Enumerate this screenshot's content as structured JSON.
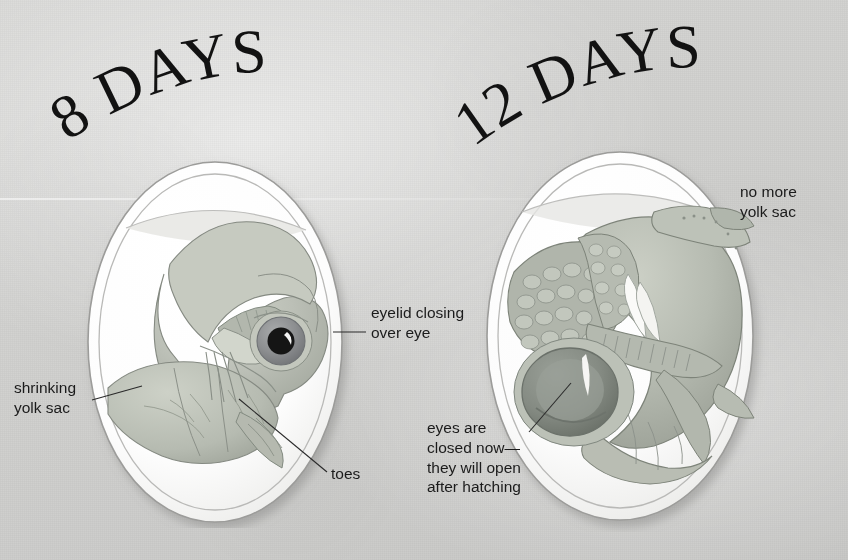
{
  "page": {
    "background_color": "#d2d2d0",
    "width": 848,
    "height": 560,
    "kind": "book-page-scan"
  },
  "panels": [
    {
      "id": "panel-8-days",
      "title": "8 DAYS",
      "subject": "bird embryo inside egg at 8 days",
      "egg": {
        "shell_color": "#ffffff",
        "outline_color": "#9a9a98",
        "center_x": 213,
        "center_y": 340,
        "radius_x": 122,
        "radius_y": 175
      },
      "embryo_colors": {
        "body": "#b9bdb4",
        "shade": "#a3a89e",
        "highlight": "#d3d7cd",
        "line": "#7e837a"
      },
      "eye": {
        "iris_color": "#8d8f91",
        "pupil_color": "#121212",
        "highlight_color": "#ffffff"
      },
      "annotations": [
        {
          "id": "annotation-eyelid",
          "text": "eyelid closing\nover eye",
          "align": "left",
          "x": 371,
          "y": 303,
          "leader": {
            "x1": 333,
            "y1": 332,
            "x2": 366,
            "y2": 332
          }
        },
        {
          "id": "annotation-shrinking-yolk-sac",
          "text": "shrinking\nyolk sac",
          "align": "left",
          "x": 14,
          "y": 378,
          "leader": {
            "x1": 92,
            "y1": 400,
            "x2": 142,
            "y2": 386
          }
        },
        {
          "id": "annotation-toes",
          "text": "toes",
          "align": "left",
          "x": 331,
          "y": 464,
          "leader": {
            "x1": 239,
            "y1": 399,
            "x2": 327,
            "y2": 472
          }
        }
      ]
    },
    {
      "id": "panel-12-days",
      "title": "12 DAYS",
      "subject": "bird embryo inside egg at 12 days",
      "egg": {
        "shell_color": "#ffffff",
        "outline_color": "#9a9a98",
        "center_x": 620,
        "center_y": 336,
        "radius_x": 133,
        "radius_y": 182
      },
      "embryo_colors": {
        "body": "#b7bbb2",
        "shade": "#9aa096",
        "highlight": "#d5d9cf",
        "line": "#7b8077"
      },
      "eye": {
        "eyelid_color": "#8e948c",
        "eyelid_shade": "#6e746c"
      },
      "annotations": [
        {
          "id": "annotation-no-more-yolk-sac",
          "text": "no more\nyolk sac",
          "align": "left",
          "x": 740,
          "y": 182,
          "leader": null
        },
        {
          "id": "annotation-eyes-closed",
          "text": "eyes are\nclosed now—\nthey will open\nafter hatching",
          "align": "left",
          "x": 427,
          "y": 418,
          "leader": {
            "x1": 529,
            "y1": 432,
            "x2": 571,
            "y2": 383
          }
        }
      ]
    }
  ]
}
